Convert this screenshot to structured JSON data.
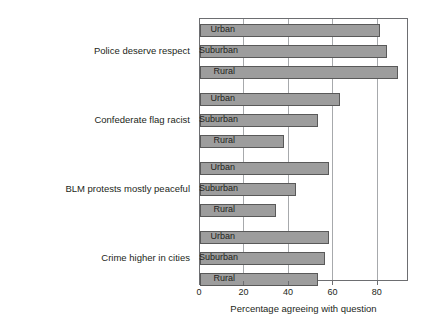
{
  "chart_data": {
    "type": "bar",
    "orientation": "horizontal",
    "title": "",
    "xlabel": "Percentage agreeing with question",
    "ylabel": "",
    "xlim": [
      0,
      94
    ],
    "xticks": [
      0,
      20,
      40,
      60,
      80
    ],
    "grid": "vertical",
    "legend": "none",
    "categories": [
      "Urban",
      "Suburban",
      "Rural"
    ],
    "groups": [
      {
        "label": "Police deserve respect",
        "bars": [
          {
            "category": "Urban",
            "value": 81
          },
          {
            "category": "Suburban",
            "value": 84
          },
          {
            "category": "Rural",
            "value": 89
          }
        ]
      },
      {
        "label": "Confederate flag racist",
        "bars": [
          {
            "category": "Urban",
            "value": 63
          },
          {
            "category": "Suburban",
            "value": 53
          },
          {
            "category": "Rural",
            "value": 38
          }
        ]
      },
      {
        "label": "BLM protests mostly peaceful",
        "bars": [
          {
            "category": "Urban",
            "value": 58
          },
          {
            "category": "Suburban",
            "value": 43
          },
          {
            "category": "Rural",
            "value": 34
          }
        ]
      },
      {
        "label": "Crime higher in cities",
        "bars": [
          {
            "category": "Urban",
            "value": 58
          },
          {
            "category": "Suburban",
            "value": 56
          },
          {
            "category": "Rural",
            "value": 53
          }
        ]
      }
    ],
    "colors": {
      "bar_fill": "#9d9d9d",
      "bar_stroke": "#595959",
      "gridline": "#a7a9ac",
      "frame": "#6d6e71",
      "text": "#231f20",
      "background": "#ffffff"
    }
  }
}
